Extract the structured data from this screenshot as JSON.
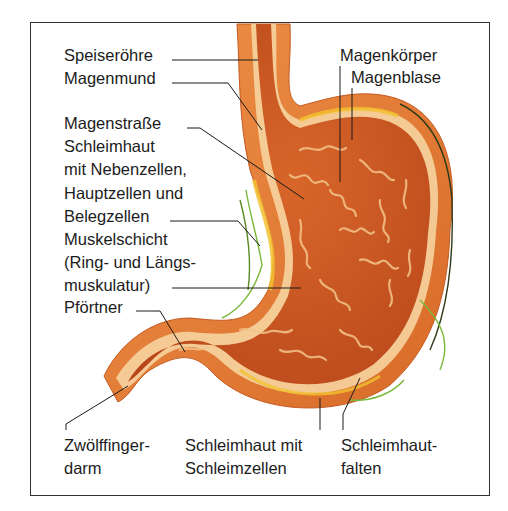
{
  "figure": {
    "colors": {
      "tissue_outer": "#e8803a",
      "tissue_inner": "#c8501a",
      "mucosa_fold": "#f3c48a",
      "lining_light": "#f8dcae",
      "yellow_layer": "#f2c230",
      "vessel_green": "#7ab83a",
      "leader_line": "#1a1a1a"
    },
    "labels": {
      "speiseroehre": "Speiseröhre",
      "magenmund": "Magenmund",
      "magenstrasse": "Magenstraße",
      "schleimhaut_1": "Schleimhaut",
      "schleimhaut_2": "mit Nebenzellen,",
      "schleimhaut_3": "Hauptzellen und",
      "schleimhaut_4": "Belegzellen",
      "muskel_1": "Muskelschicht",
      "muskel_2": "(Ring- und Längs-",
      "muskel_3": "muskulatur)",
      "pfoertner": "Pförtner",
      "magenkoerper": "Magenkörper",
      "magenblase": "Magenblase",
      "zwoelf_1": "Zwölffinger-",
      "zwoelf_2": "darm",
      "schleimzellen_1": "Schleimhaut mit",
      "schleimzellen_2": "Schleimzellen",
      "falten_1": "Schleimhaut-",
      "falten_2": "falten"
    }
  }
}
